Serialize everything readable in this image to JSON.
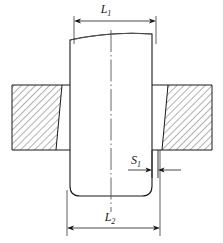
{
  "figure": {
    "type": "engineering-cross-section-drawing",
    "title": "",
    "background_color": "#ffffff",
    "line_color": "#1a1a1a",
    "hatch_color": "#3a3a3a",
    "centerline_color": "#555555"
  },
  "dimensions": [
    {
      "id": "L1",
      "symbol": "L",
      "subscript": "1",
      "label": "L₁",
      "position": "top",
      "arrow_style": "outward-ends",
      "from_x": 74,
      "to_x": 156,
      "line_y": 21
    },
    {
      "id": "S1",
      "symbol": "S",
      "subscript": "1",
      "label": "S₁",
      "position": "middle-right",
      "arrow_style": "inward-pair",
      "from_x": 130,
      "to_x": 180,
      "line_y": 170
    },
    {
      "id": "L2",
      "symbol": "L",
      "subscript": "2",
      "label": "L₂",
      "position": "bottom",
      "arrow_style": "outward-ends",
      "from_x": 67,
      "to_x": 160,
      "line_y": 228
    }
  ],
  "parts": [
    {
      "id": "center-body",
      "name": "central-workpiece",
      "description": "vertical body with curved top edge and rounded bottom corners",
      "left_x": 70,
      "right_x": 152,
      "top_y": 34,
      "bottom_y": 196,
      "corner_radius": 10,
      "top_edge": "curved-arc-rising-right",
      "filled": false
    },
    {
      "id": "left-block",
      "name": "left-hatched-block",
      "description": "sectioned material block, 45 degree hatch, slanted inner edge",
      "left_x": 12,
      "right_x_top": 62,
      "right_x_bottom": 56,
      "top_y": 85,
      "bottom_y": 150,
      "hatch_angle_deg": 45,
      "hatch_spacing": 5
    },
    {
      "id": "right-block",
      "name": "right-hatched-block",
      "description": "sectioned material block, 45 degree hatch, slanted inner edge",
      "left_x_top": 168,
      "left_x_bottom": 162,
      "right_x": 212,
      "top_y": 85,
      "bottom_y": 150,
      "hatch_angle_deg": 45,
      "hatch_spacing": 5
    },
    {
      "id": "left-shoulder",
      "name": "left-shoulder-plate",
      "left_x": 56,
      "right_x": 70,
      "top_y": 85,
      "bottom_y": 150
    },
    {
      "id": "right-shoulder",
      "name": "right-shoulder-plate",
      "left_x": 152,
      "right_x": 168,
      "top_y": 85,
      "bottom_y": 150
    }
  ],
  "centerline": {
    "name": "axis-centerline",
    "style": "dash-dot",
    "x": 111,
    "top_y": 30,
    "bottom_y": 212
  }
}
